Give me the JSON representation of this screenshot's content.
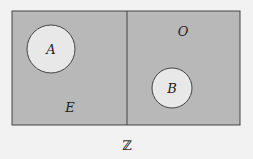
{
  "diagram": {
    "type": "venn",
    "universe_label": "ℤ",
    "regions": [
      {
        "id": "E",
        "label": "E"
      },
      {
        "id": "O",
        "label": "O"
      }
    ],
    "sets": [
      {
        "id": "A",
        "label": "A",
        "within": "E"
      },
      {
        "id": "B",
        "label": "B",
        "within": "O"
      }
    ],
    "colors": {
      "background": "#f2f2f2",
      "region_fill": "#b8b8b8",
      "circle_fill": "#e8e8e8",
      "stroke": "#444444"
    }
  }
}
